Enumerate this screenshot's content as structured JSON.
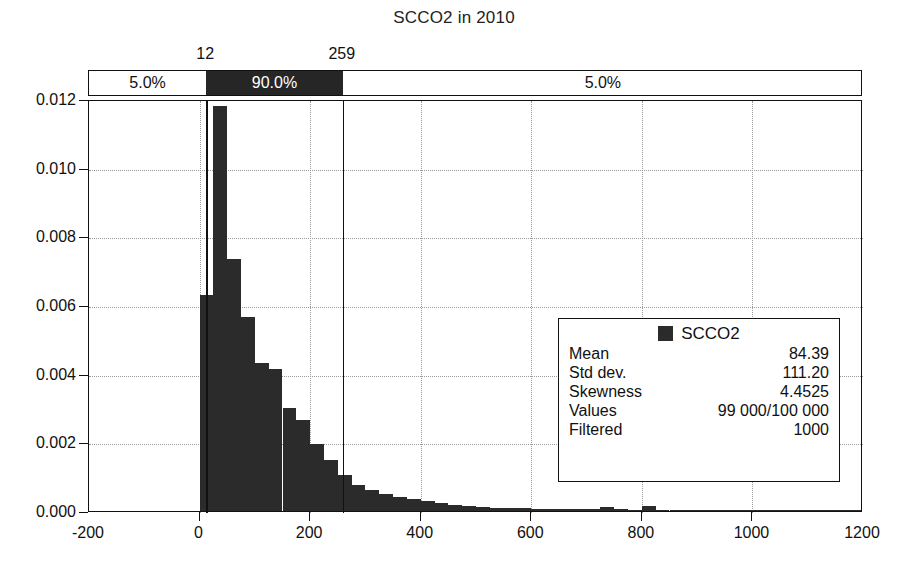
{
  "chart_data": {
    "type": "bar",
    "title": "SCCO2 in 2010",
    "xlabel": "",
    "ylabel": "",
    "xlim": [
      -200,
      1200
    ],
    "ylim": [
      0.0,
      0.012
    ],
    "grid": true,
    "legend_position": "center-right",
    "xticks": [
      "-200",
      "0",
      "200",
      "400",
      "600",
      "800",
      "1000",
      "1200"
    ],
    "xtick_values": [
      -200,
      0,
      200,
      400,
      600,
      800,
      1000,
      1200
    ],
    "yticks": [
      "0.000",
      "0.002",
      "0.004",
      "0.006",
      "0.008",
      "0.010",
      "0.012"
    ],
    "ytick_values": [
      0.0,
      0.002,
      0.004,
      0.006,
      0.008,
      0.01,
      0.012
    ],
    "bin_width": 25,
    "series": [
      {
        "name": "SCCO2",
        "color": "#2b2b2b",
        "bin_starts": [
          0,
          25,
          50,
          75,
          100,
          125,
          150,
          175,
          200,
          225,
          250,
          275,
          300,
          325,
          350,
          375,
          400,
          425,
          450,
          475,
          500,
          525,
          550,
          575,
          600,
          625,
          650,
          675,
          700,
          725,
          750,
          775,
          800,
          825,
          850,
          875,
          900,
          925,
          950,
          975,
          1000,
          1025,
          1050,
          1075,
          1100,
          1125,
          1150,
          1175
        ],
        "values": [
          0.0063,
          0.0118,
          0.00735,
          0.00565,
          0.0043,
          0.00415,
          0.003,
          0.00265,
          0.00195,
          0.0015,
          0.00105,
          0.00075,
          0.0006,
          0.0005,
          0.0004,
          0.00034,
          0.00028,
          0.00022,
          0.00018,
          0.00015,
          0.00012,
          0.0001,
          9e-05,
          8e-05,
          7e-05,
          6e-05,
          6e-05,
          5e-05,
          5e-05,
          0.00013,
          5e-05,
          4e-05,
          0.00014,
          4e-05,
          3e-05,
          3e-05,
          3e-05,
          2e-05,
          2e-05,
          2e-05,
          2e-05,
          2e-05,
          1e-05,
          1e-05,
          1e-05,
          1e-05,
          1e-05,
          1e-05
        ]
      }
    ],
    "percentile_band": {
      "lower_label": "12",
      "upper_label": "259",
      "lower_value": 12,
      "upper_value": 259,
      "left_pct": "5.0%",
      "middle_pct": "90.0%",
      "right_pct": "5.0%"
    },
    "annotations": []
  },
  "legend": {
    "series_label": "SCCO2",
    "rows": [
      {
        "key": "Mean",
        "value": "84.39"
      },
      {
        "key": "Std dev.",
        "value": "111.20"
      },
      {
        "key": "Skewness",
        "value": "4.4525"
      },
      {
        "key": "Values",
        "value": "99 000/100 000"
      },
      {
        "key": "Filtered",
        "value": "1000"
      }
    ]
  },
  "colors": {
    "bar": "#2b2b2b",
    "band_dark": "#262626",
    "axis": "#111111",
    "grid": "#9a9a9a",
    "background": "#ffffff"
  }
}
